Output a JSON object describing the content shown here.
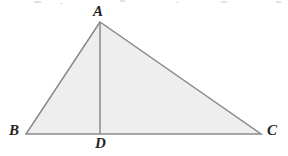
{
  "figure": {
    "kind": "geometry-diagram",
    "width": 288,
    "height": 156,
    "background_color": "#ffffff",
    "fill_color": "#eeeeee",
    "stroke_color": "#8a8a8a",
    "stroke_width": 1.5,
    "label_color": "#252525"
  },
  "labels": {
    "apex": "A",
    "bottom_left": "B",
    "bottom_right": "C",
    "altitude_foot": "D"
  },
  "chart_data": {
    "type": "scatter",
    "title": "",
    "xlabel": "",
    "ylabel": "",
    "points": [
      {
        "name": "A",
        "x": 100,
        "y": 22
      },
      {
        "name": "B",
        "x": 26,
        "y": 134
      },
      {
        "name": "C",
        "x": 261,
        "y": 134
      },
      {
        "name": "D",
        "x": 100,
        "y": 134
      }
    ],
    "segments": [
      {
        "from": "A",
        "to": "B"
      },
      {
        "from": "A",
        "to": "C"
      },
      {
        "from": "B",
        "to": "C"
      },
      {
        "from": "A",
        "to": "D"
      }
    ],
    "polygon": [
      "A",
      "B",
      "C"
    ]
  },
  "artifacts": {
    "specks": [
      {
        "x": 34,
        "y": 1,
        "w": 7,
        "h": 2
      },
      {
        "x": 120,
        "y": 0,
        "w": 5,
        "h": 2
      },
      {
        "x": 221,
        "y": 1,
        "w": 6,
        "h": 2
      },
      {
        "x": 276,
        "y": 1,
        "w": 5,
        "h": 2
      },
      {
        "x": 60,
        "y": 3,
        "w": 3,
        "h": 1
      },
      {
        "x": 176,
        "y": 2,
        "w": 3,
        "h": 1
      }
    ]
  }
}
